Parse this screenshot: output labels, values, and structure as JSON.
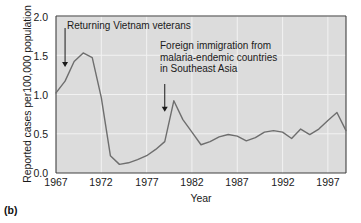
{
  "figure": {
    "panel_caption": "(b)",
    "background_color": "#dcdcdc",
    "line_color": "#6e6e6e",
    "grid_color": "#f2f2f2",
    "axis_color": "#404040"
  },
  "axes": {
    "ylabel": "Reported cases per100,000 population",
    "xlabel": "Year",
    "yticks": [
      "0.0",
      "0.5",
      "1.0",
      "1.5",
      "2.0"
    ],
    "xticks": [
      "1967",
      "1972",
      "1977",
      "1982",
      "1987",
      "1992",
      "1997"
    ]
  },
  "annotations": [
    {
      "name": "returning-vietnam-veterans",
      "text": "Returning Vietnam veterans",
      "arrow_year": 1968,
      "arrow_value": 1.35
    },
    {
      "name": "foreign-immigration-southeast-asia",
      "text": "Foreign immigration from\nmalaria-endemic countries\nin Southeast Asia",
      "arrow_year": 1979,
      "arrow_value": 0.78
    }
  ],
  "chart_data": {
    "type": "line",
    "title": "",
    "xlabel": "Year",
    "ylabel": "Reported cases per100,000 population",
    "xlim": [
      1967,
      1999
    ],
    "ylim": [
      0.0,
      2.0
    ],
    "xticks": [
      1967,
      1972,
      1977,
      1982,
      1987,
      1992,
      1997
    ],
    "yticks": [
      0.0,
      0.5,
      1.0,
      1.5,
      2.0
    ],
    "grid": true,
    "legend": "none",
    "x": [
      1967,
      1968,
      1969,
      1970,
      1971,
      1972,
      1973,
      1974,
      1975,
      1976,
      1977,
      1978,
      1979,
      1980,
      1981,
      1982,
      1983,
      1984,
      1985,
      1986,
      1987,
      1988,
      1989,
      1990,
      1991,
      1992,
      1993,
      1994,
      1995,
      1996,
      1997,
      1998,
      1999
    ],
    "y": [
      1.02,
      1.17,
      1.42,
      1.53,
      1.47,
      0.96,
      0.22,
      0.11,
      0.13,
      0.17,
      0.22,
      0.3,
      0.4,
      0.92,
      0.68,
      0.52,
      0.36,
      0.4,
      0.46,
      0.49,
      0.47,
      0.41,
      0.45,
      0.52,
      0.54,
      0.52,
      0.44,
      0.56,
      0.49,
      0.56,
      0.67,
      0.77,
      0.54
    ]
  }
}
